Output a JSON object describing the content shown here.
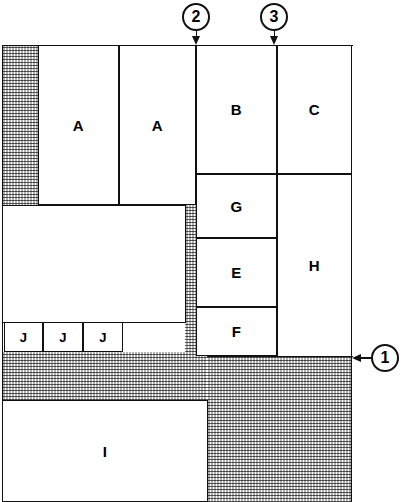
{
  "diagram": {
    "canvas": {
      "width": 409,
      "height": 502
    },
    "colors": {
      "line": "#111111",
      "fill": "#ffffff",
      "hatch": "#9e9e9e"
    },
    "callouts": [
      {
        "id": "1",
        "label": "1",
        "direction": "left",
        "cx": 385,
        "cy": 358
      },
      {
        "id": "2",
        "label": "2",
        "direction": "down",
        "cx": 196,
        "cy": 17
      },
      {
        "id": "3",
        "label": "3",
        "direction": "down",
        "cx": 274,
        "cy": 17
      }
    ],
    "rooms": [
      {
        "key": "a1",
        "label": "A",
        "x": 38,
        "y": 45,
        "w": 81,
        "h": 160
      },
      {
        "key": "a2",
        "label": "A",
        "x": 119,
        "y": 45,
        "w": 77,
        "h": 160
      },
      {
        "key": "b",
        "label": "B",
        "x": 196,
        "y": 45,
        "w": 81,
        "h": 129
      },
      {
        "key": "c",
        "label": "C",
        "x": 277,
        "y": 45,
        "w": 75,
        "h": 129
      },
      {
        "key": "g",
        "label": "G",
        "x": 196,
        "y": 174,
        "w": 81,
        "h": 64
      },
      {
        "key": "e",
        "label": "E",
        "x": 196,
        "y": 238,
        "w": 81,
        "h": 69
      },
      {
        "key": "f",
        "label": "F",
        "x": 196,
        "y": 307,
        "w": 81,
        "h": 49
      },
      {
        "key": "h",
        "label": "H",
        "x": 277,
        "y": 174,
        "w": 75,
        "h": 183
      },
      {
        "key": "mid",
        "label": "",
        "x": 2,
        "y": 205,
        "w": 184,
        "h": 118
      },
      {
        "key": "j1",
        "label": "J",
        "x": 4,
        "y": 322,
        "w": 39,
        "h": 30
      },
      {
        "key": "j2",
        "label": "J",
        "x": 43,
        "y": 322,
        "w": 40,
        "h": 30
      },
      {
        "key": "j3",
        "label": "J",
        "x": 83,
        "y": 322,
        "w": 40,
        "h": 30
      },
      {
        "key": "i",
        "label": "I",
        "x": 2,
        "y": 400,
        "w": 206,
        "h": 102
      }
    ],
    "hatched_areas": [
      {
        "key": "left-strip",
        "x": 2,
        "y": 45,
        "w": 36,
        "h": 160
      },
      {
        "key": "mid-strip",
        "x": 185,
        "y": 205,
        "w": 11,
        "h": 150
      },
      {
        "key": "lower-band",
        "x": 2,
        "y": 352,
        "w": 350,
        "h": 50
      },
      {
        "key": "bottom-right",
        "x": 207,
        "y": 352,
        "w": 145,
        "h": 150
      }
    ]
  }
}
